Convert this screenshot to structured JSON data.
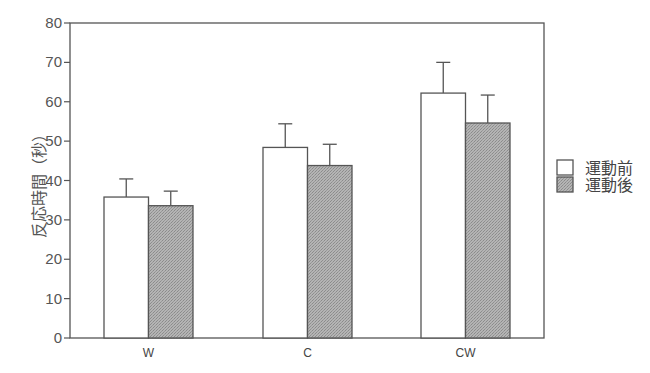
{
  "chart_data": {
    "type": "bar",
    "title": "",
    "xlabel": "",
    "ylabel": "反応時間（秒）",
    "ylim": [
      0,
      80
    ],
    "yticks": [
      0,
      10,
      20,
      30,
      40,
      50,
      60,
      70,
      80
    ],
    "grid": false,
    "legend_position": "right",
    "categories": [
      "W",
      "C",
      "CW"
    ],
    "series": [
      {
        "name": "運動前",
        "fill": "#ffffff",
        "values": [
          35.8,
          48.4,
          62.2
        ],
        "error": [
          4.6,
          6.0,
          7.8
        ]
      },
      {
        "name": "運動後",
        "fill": "#aaaaaa",
        "values": [
          33.6,
          43.8,
          54.6
        ],
        "error": [
          3.7,
          5.4,
          7.1
        ]
      }
    ]
  }
}
